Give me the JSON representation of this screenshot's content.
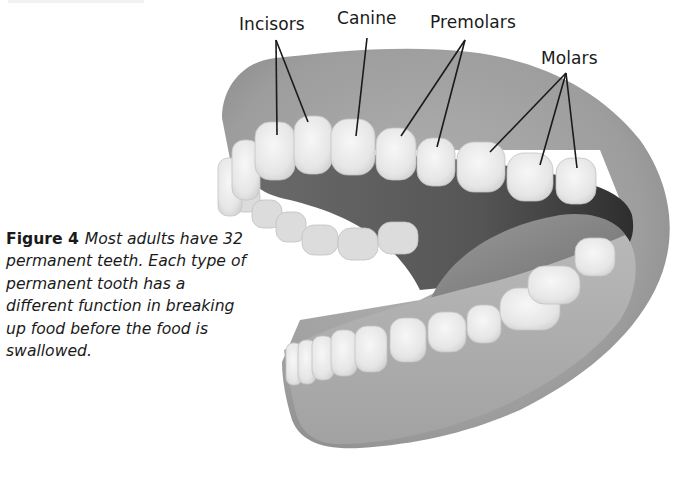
{
  "figure": {
    "number_label": "Figure 4",
    "caption": "Most adults have 32 permanent teeth. Each type of permanent tooth has a different function in breaking up food before the food is swallowed.",
    "illustration": "open-mouth-teeth-diagram",
    "labels": [
      {
        "id": "incisors",
        "text": "Incisors"
      },
      {
        "id": "canine",
        "text": "Canine"
      },
      {
        "id": "premolars",
        "text": "Premolars"
      },
      {
        "id": "molars",
        "text": "Molars"
      }
    ]
  },
  "colors": {
    "background": "#ffffff",
    "text": "#1a1a1a",
    "gum": "#9a9a9a",
    "gum_dark": "#7d7d7d",
    "mouth_interior": "#4a4a4a",
    "tongue": "#8e8e8e",
    "tooth": "#ececec",
    "leader_line": "#1a1a1a"
  }
}
